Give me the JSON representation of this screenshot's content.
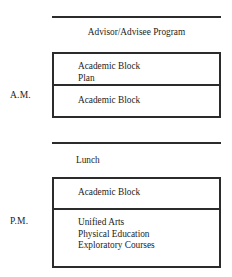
{
  "diagram": {
    "line_color": "#2b2b2b",
    "background": "#ffffff",
    "periods": [
      {
        "key": "am",
        "label": "A.M."
      },
      {
        "key": "pm",
        "label": "P.M."
      }
    ],
    "rows": {
      "advisor": {
        "text": "Advisor/Advisee Program"
      },
      "am_block_1": {
        "lines": [
          "Academic Block",
          "Plan"
        ]
      },
      "am_block_2": {
        "lines": [
          "Academic Block"
        ]
      },
      "lunch": {
        "text": "Lunch"
      },
      "pm_block_1": {
        "lines": [
          "Academic Block"
        ]
      },
      "pm_block_2": {
        "lines": [
          "Unified Arts",
          "Physical Education",
          "Exploratory Courses"
        ]
      }
    }
  }
}
